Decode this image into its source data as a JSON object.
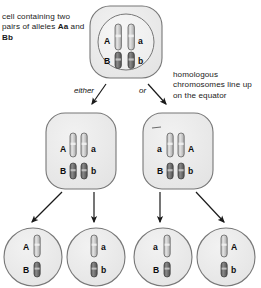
{
  "diagram": {
    "type": "biology-process-diagram",
    "colors": {
      "cell_fill": "#ececec",
      "cell_stroke": "#6f6f6f",
      "nucleus_fill": "#f3f3f3",
      "nucleus_stroke": "#6f6f6f",
      "chromosome_light_fill": "#c9c9c9",
      "chromosome_dark_fill": "#6e6e6e",
      "chromosome_stroke": "#4a4a4a",
      "arrow": "#1a1a1a",
      "text": "#1a1a1a"
    }
  },
  "captions": {
    "left": {
      "line1": "cell containing two",
      "line2_pre": "pairs of alleles ",
      "line2_bold": "Aa",
      "line3_pre": "and ",
      "line3_bold": "Bb"
    },
    "right": {
      "line1": "homologous",
      "line2": "chromosomes line",
      "line3": "up on the equator"
    }
  },
  "branches": {
    "either_label": "either",
    "or_label": "or"
  },
  "parent_cell": {
    "name": "parent-cell",
    "chromosomes": [
      {
        "id": "top-left",
        "shade": "light",
        "label": "A",
        "label_side": "left"
      },
      {
        "id": "top-right",
        "shade": "light",
        "label": "a",
        "label_side": "right"
      },
      {
        "id": "bottom-left",
        "shade": "dark",
        "label": "B",
        "label_side": "left"
      },
      {
        "id": "bottom-right",
        "shade": "dark",
        "label": "b",
        "label_side": "right"
      }
    ]
  },
  "metaphase_cells": [
    {
      "name": "metaphase-cell-left",
      "chromosomes": [
        {
          "id": "top-left",
          "shade": "light",
          "label": "A",
          "label_side": "left"
        },
        {
          "id": "top-right",
          "shade": "light",
          "label": "a",
          "label_side": "right"
        },
        {
          "id": "bottom-left",
          "shade": "dark",
          "label": "B",
          "label_side": "left"
        },
        {
          "id": "bottom-right",
          "shade": "dark",
          "label": "b",
          "label_side": "right"
        }
      ]
    },
    {
      "name": "metaphase-cell-right",
      "chromosomes": [
        {
          "id": "top-left",
          "shade": "light",
          "label": "a",
          "label_side": "left"
        },
        {
          "id": "top-right",
          "shade": "light",
          "label": "A",
          "label_side": "right"
        },
        {
          "id": "bottom-left",
          "shade": "dark",
          "label": "B",
          "label_side": "left"
        },
        {
          "id": "bottom-right",
          "shade": "dark",
          "label": "b",
          "label_side": "right"
        }
      ]
    }
  ],
  "gametes": [
    {
      "name": "gamete-1",
      "chromosomes": [
        {
          "id": "upper",
          "shade": "light",
          "label": "A",
          "label_side": "left"
        },
        {
          "id": "lower",
          "shade": "dark",
          "label": "B",
          "label_side": "left"
        }
      ]
    },
    {
      "name": "gamete-2",
      "chromosomes": [
        {
          "id": "upper",
          "shade": "light",
          "label": "a",
          "label_side": "right"
        },
        {
          "id": "lower",
          "shade": "dark",
          "label": "b",
          "label_side": "right"
        }
      ]
    },
    {
      "name": "gamete-3",
      "chromosomes": [
        {
          "id": "upper",
          "shade": "light",
          "label": "a",
          "label_side": "left"
        },
        {
          "id": "lower",
          "shade": "dark",
          "label": "B",
          "label_side": "left"
        }
      ]
    },
    {
      "name": "gamete-4",
      "chromosomes": [
        {
          "id": "upper",
          "shade": "light",
          "label": "A",
          "label_side": "right"
        },
        {
          "id": "lower",
          "shade": "dark",
          "label": "b",
          "label_side": "right"
        }
      ]
    }
  ]
}
